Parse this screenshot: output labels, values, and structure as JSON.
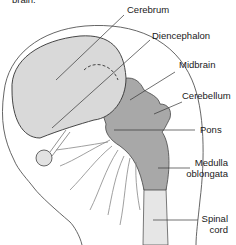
{
  "diagram": {
    "caption_fragment": "brain.",
    "labels": {
      "cerebrum": "Cerebrum",
      "diencephalon": "Diencephalon",
      "midbrain": "Midbrain",
      "cerebellum": "Cerebellum",
      "pons": "Pons",
      "medulla_line1": "Medulla",
      "medulla_line2": "oblongata",
      "spinal_line1": "Spinal",
      "spinal_line2": "cord"
    },
    "colors": {
      "cerebrum_fill": "#d8d8d8",
      "brainstem_fill": "#a9a9a9",
      "spinal_fill": "#e6e6e6",
      "outline": "#333333",
      "leader": "#333333"
    }
  }
}
